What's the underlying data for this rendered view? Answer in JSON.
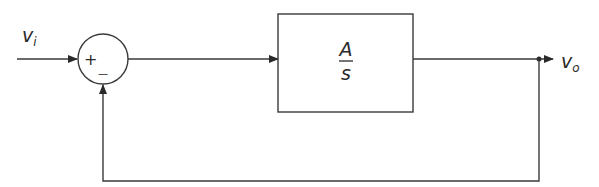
{
  "diagram": {
    "type": "feedback-block-diagram",
    "input_label": {
      "main": "v",
      "sub": "i"
    },
    "output_label": {
      "main": "v",
      "sub": "o"
    },
    "summing_junction": {
      "plus_sign": "+",
      "minus_sign": "—"
    },
    "forward_block": {
      "numerator": "A",
      "denominator": "s"
    },
    "colors": {
      "line": "#3a3a3a",
      "text": "#2a2a2a",
      "background": "#ffffff"
    }
  }
}
